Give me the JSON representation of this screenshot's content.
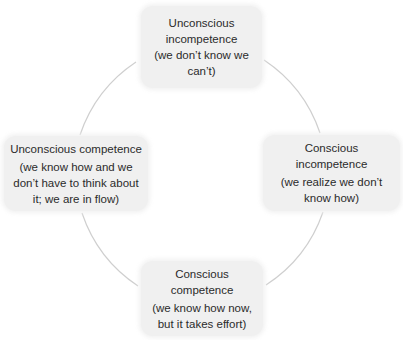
{
  "diagram": {
    "type": "cycle",
    "colors": {
      "node_fill": "#f0f0f0",
      "text": "#2b2b2b",
      "connector": "#cfcfcf"
    },
    "nodes": [
      {
        "id": "top",
        "title": "Unconscious incompetence",
        "title_lines": [
          "Unconscious",
          "incompetence"
        ],
        "description": "(we don’t know we can’t)"
      },
      {
        "id": "right",
        "title": "Conscious incompetence",
        "description": "(we realize we don’t know how)",
        "description_lines": [
          "(we realize we don’t",
          "know how)"
        ]
      },
      {
        "id": "bottom",
        "title": "Conscious competence",
        "description": "(we know how now, but it takes effort)",
        "description_lines": [
          "(we know how now,",
          "but it takes effort)"
        ]
      },
      {
        "id": "left",
        "title": "Unconscious competence",
        "description": "(we know how and we don’t have to think about it; we are in flow)",
        "description_lines": [
          "(we know how and we",
          "don’t have to think about",
          "it; we are in flow)"
        ]
      }
    ],
    "connections": [
      {
        "from": "top",
        "to": "right"
      },
      {
        "from": "right",
        "to": "bottom"
      },
      {
        "from": "bottom",
        "to": "left"
      },
      {
        "from": "left",
        "to": "top"
      }
    ]
  }
}
